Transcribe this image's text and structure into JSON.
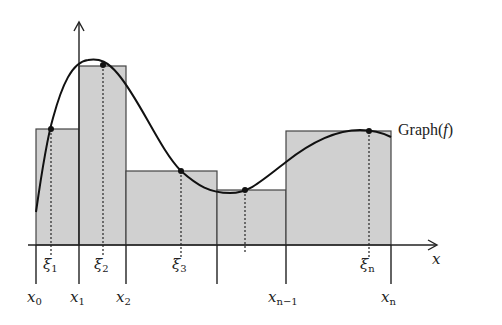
{
  "diagram": {
    "curve_label": "Graph(f)",
    "curve_label_parts": {
      "prefix": "Graph(",
      "fn": "f",
      "suffix": ")"
    },
    "axis_x_label": "x",
    "partition_labels": [
      {
        "base": "x",
        "sub": "0"
      },
      {
        "base": "x",
        "sub": "1"
      },
      {
        "base": "x",
        "sub": "2"
      },
      {
        "base": "x",
        "sub": "n−1"
      },
      {
        "base": "x",
        "sub": "n"
      }
    ],
    "sample_labels": [
      {
        "base": "ξ",
        "sub": "1"
      },
      {
        "base": "ξ",
        "sub": "2"
      },
      {
        "base": "ξ",
        "sub": "3"
      },
      {
        "base": "ξ",
        "sub": "n"
      }
    ],
    "colors": {
      "rect_fill": "#d0d0d0",
      "rect_stroke": "#444444",
      "curve": "#111111",
      "axis": "#222222"
    }
  }
}
